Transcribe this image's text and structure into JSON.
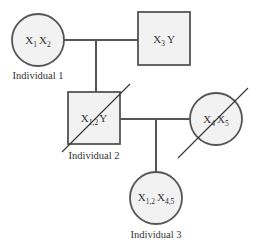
{
  "diagram": {
    "type": "pedigree",
    "colors": {
      "fill": "#f2f2f2",
      "stroke": "#555555",
      "text": "#333333"
    },
    "individuals": [
      {
        "id": "ind1",
        "shape": "circle",
        "sex": "female",
        "genotype": {
          "base1": "X",
          "sub1": "1",
          "base2": "X",
          "sub2": "2"
        },
        "label": "Individual 1",
        "deceased": false
      },
      {
        "id": "father",
        "shape": "square",
        "sex": "male",
        "genotype": {
          "base1": "X",
          "sub1": "3",
          "base2": "Y",
          "sub2": ""
        },
        "label": "",
        "deceased": false
      },
      {
        "id": "ind2",
        "shape": "square",
        "sex": "male",
        "genotype": {
          "base1": "X",
          "sub1": "1,2",
          "base2": "Y",
          "sub2": ""
        },
        "label": "Individual 2",
        "deceased": true
      },
      {
        "id": "mate",
        "shape": "circle",
        "sex": "female",
        "genotype": {
          "base1": "X",
          "sub1": "4",
          "base2": "X",
          "sub2": "5"
        },
        "label": "",
        "deceased": true
      },
      {
        "id": "ind3",
        "shape": "circle",
        "sex": "female",
        "genotype": {
          "base1": "X",
          "sub1": "1,2",
          "base2": "X",
          "sub2": "4,5"
        },
        "label": "Individual 3",
        "deceased": false
      }
    ],
    "relationships": [
      {
        "type": "mating",
        "between": [
          "ind1",
          "father"
        ],
        "children": [
          "ind2"
        ]
      },
      {
        "type": "mating",
        "between": [
          "ind2",
          "mate"
        ],
        "children": [
          "ind3"
        ]
      }
    ]
  }
}
